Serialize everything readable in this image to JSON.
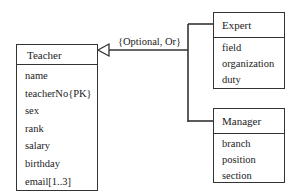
{
  "diagram": {
    "type": "UML class diagram (generalization)",
    "constraint_label": "{Optional, Or}",
    "superclass": {
      "name": "Teacher",
      "attributes": [
        "name",
        "teacherNo{PK}",
        "sex",
        "rank",
        "salary",
        "birthday",
        "email[1..3]"
      ]
    },
    "subclasses": [
      {
        "name": "Expert",
        "attributes": [
          "field",
          "organization",
          "duty"
        ]
      },
      {
        "name": "Manager",
        "attributes": [
          "branch",
          "position",
          "section"
        ]
      }
    ],
    "colors": {
      "line": "#333333",
      "background": "#ffffff",
      "text": "#222222"
    }
  }
}
